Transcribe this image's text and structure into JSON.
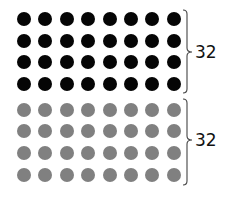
{
  "groups": [
    {
      "name": "black-dots",
      "color": "#050505",
      "rows": 4,
      "cols": 8,
      "count_label": "32",
      "row_y": [
        19,
        41,
        62,
        84
      ],
      "brace": {
        "top": 10,
        "bottom": 93,
        "mid": 52
      },
      "label_y": 44
    },
    {
      "name": "gray-dots",
      "color": "#808080",
      "rows": 4,
      "cols": 8,
      "count_label": "32",
      "row_y": [
        110,
        131,
        153,
        175
      ],
      "brace": {
        "top": 99,
        "bottom": 185,
        "mid": 140
      },
      "label_y": 132
    }
  ],
  "col_x": [
    24,
    45,
    67,
    88,
    110,
    131,
    152,
    174
  ],
  "dot_diameter": 14,
  "brace_x": 186,
  "label_x": 195
}
